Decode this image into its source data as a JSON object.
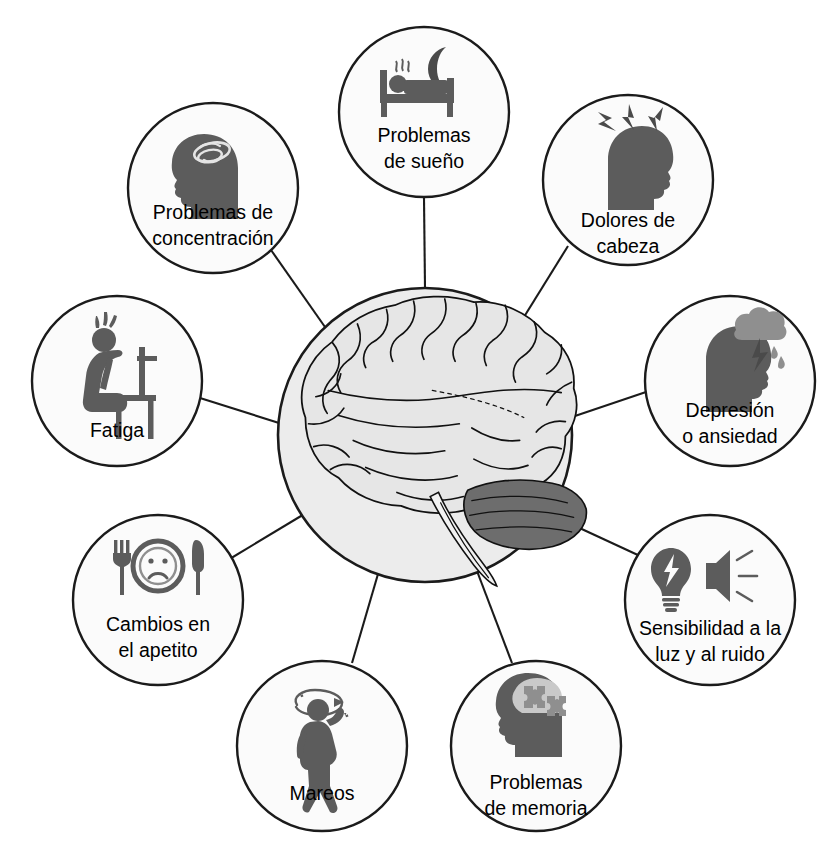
{
  "diagram": {
    "type": "hub-and-spoke",
    "title_visible": false,
    "center": {
      "name": "brain",
      "icon": "brain-illustration",
      "fill_color": "#ececec",
      "stroke_color": "#1b1b1b",
      "cx": 425,
      "cy": 435,
      "r": 147
    },
    "node_style": {
      "fill_color": "#fbfbfb",
      "stroke_color": "#1b1b1b",
      "text_color": "#000000",
      "icon_color": "#5c5c5c"
    },
    "nodes": [
      {
        "id": "problemas-de-sueno",
        "icon": "bed-moon-icon",
        "lines": [
          "Problemas",
          "de sueño"
        ],
        "cx": 424,
        "cy": 112,
        "r": 85
      },
      {
        "id": "dolores-de-cabeza",
        "icon": "head-lightning-icon",
        "lines": [
          "Dolores de",
          "cabeza"
        ],
        "cx": 628,
        "cy": 180,
        "r": 85
      },
      {
        "id": "depresion-o-ansiedad",
        "icon": "head-storm-cloud-icon",
        "lines": [
          "Depresión",
          "o ansiedad"
        ],
        "cx": 730,
        "cy": 381,
        "r": 85
      },
      {
        "id": "sensibilidad-a-la-luz-y-al-ruido",
        "icon": "bulb-speaker-icon",
        "lines": [
          "Sensibilidad a la",
          "luz y al ruido"
        ],
        "cx": 710,
        "cy": 600,
        "r": 85
      },
      {
        "id": "problemas-de-memoria",
        "icon": "head-puzzle-icon",
        "lines": [
          "Problemas",
          "de memoria"
        ],
        "cx": 536,
        "cy": 746,
        "r": 85
      },
      {
        "id": "mareos",
        "icon": "dizzy-person-icon",
        "lines": [
          "Mareos"
        ],
        "cx": 322,
        "cy": 746,
        "r": 85
      },
      {
        "id": "cambios-en-el-apetito",
        "icon": "plate-sad-face-icon",
        "lines": [
          "Cambios en",
          "el apetito"
        ],
        "cx": 158,
        "cy": 600,
        "r": 85
      },
      {
        "id": "fatiga",
        "icon": "tired-person-chair-icon",
        "lines": [
          "Fatiga"
        ],
        "cx": 117,
        "cy": 381,
        "r": 85
      },
      {
        "id": "problemas-de-concentracion",
        "icon": "head-swirl-icon",
        "lines": [
          "Problemas de",
          "concentración"
        ],
        "cx": 213,
        "cy": 188,
        "r": 85
      }
    ]
  }
}
